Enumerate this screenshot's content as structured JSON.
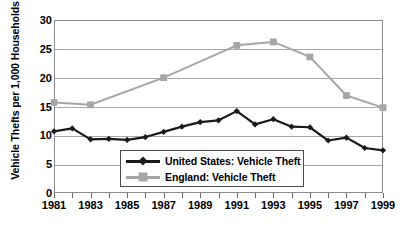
{
  "chart_data": {
    "type": "line",
    "title": "",
    "xlabel": "",
    "ylabel": "Vehicle Thefts per 1,000 Households",
    "ylim": [
      0,
      30
    ],
    "xlim": [
      1981,
      1999
    ],
    "yticks": [
      0,
      5,
      10,
      15,
      20,
      25,
      30
    ],
    "ytick_labels": [
      "0",
      "5",
      "10",
      "15",
      "20",
      "25",
      "30"
    ],
    "xticks": [
      1981,
      1982,
      1983,
      1984,
      1985,
      1986,
      1987,
      1988,
      1989,
      1990,
      1991,
      1992,
      1993,
      1994,
      1995,
      1996,
      1997,
      1998,
      1999
    ],
    "xtick_labels": [
      "1981",
      "",
      "1983",
      "",
      "1985",
      "",
      "1987",
      "",
      "1989",
      "",
      "1991",
      "",
      "1993",
      "",
      "1995",
      "",
      "1997",
      "",
      "1999"
    ],
    "x": [
      1981,
      1982,
      1983,
      1984,
      1985,
      1986,
      1987,
      1988,
      1989,
      1990,
      1991,
      1992,
      1993,
      1994,
      1995,
      1996,
      1997,
      1998,
      1999
    ],
    "grid": true,
    "grid_axis": "y",
    "legend_position": "lower-center",
    "series": [
      {
        "name": "United States: Vehicle Theft",
        "color": "#1a1a1a",
        "marker": "diamond",
        "values": [
          10.7,
          11.2,
          9.3,
          9.4,
          9.2,
          9.7,
          10.6,
          11.5,
          12.3,
          12.6,
          14.2,
          11.9,
          12.8,
          11.5,
          11.4,
          9.1,
          9.6,
          7.8,
          7.4
        ]
      },
      {
        "name": "England: Vehicle Theft",
        "color": "#a6a6a6",
        "marker": "square",
        "values": [
          15.7,
          null,
          15.3,
          null,
          null,
          null,
          20.0,
          null,
          null,
          null,
          25.6,
          null,
          26.2,
          null,
          23.6,
          null,
          16.9,
          null,
          14.8
        ]
      }
    ]
  },
  "legend": {
    "items": [
      {
        "label": "United States: Vehicle Theft",
        "color": "#1a1a1a",
        "marker": "diamond"
      },
      {
        "label": "England: Vehicle Theft",
        "color": "#a6a6a6",
        "marker": "square"
      }
    ]
  },
  "colors": {
    "us_series": "#1a1a1a",
    "england_series": "#a6a6a6",
    "gridline": "#a8a8a8",
    "frame": "#8c8c8c",
    "background": "#ffffff",
    "text": "#000000"
  }
}
